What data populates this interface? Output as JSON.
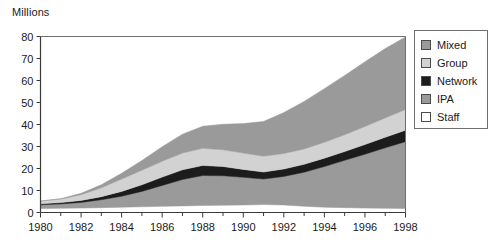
{
  "chart_data": {
    "type": "area",
    "stacked": true,
    "title": "",
    "subtitle": "",
    "unit_label": "Millions",
    "xlabel": "",
    "ylabel": "Millions",
    "xlim": [
      1980,
      1998
    ],
    "ylim": [
      0,
      80
    ],
    "y_ticks": [
      0,
      10,
      20,
      30,
      40,
      50,
      60,
      70,
      80
    ],
    "x_ticks": [
      1980,
      1982,
      1984,
      1986,
      1988,
      1990,
      1992,
      1994,
      1996,
      1998
    ],
    "x_tick_labels": [
      "1980",
      "1982",
      "1984",
      "1986",
      "1988",
      "1990",
      "1992",
      "1994",
      "1996",
      "1998"
    ],
    "y_tick_labels": [
      "0",
      "10",
      "20",
      "30",
      "40",
      "50",
      "60",
      "70",
      "80"
    ],
    "x_minor_ticks": [
      1981,
      1983,
      1985,
      1987,
      1989,
      1991,
      1993,
      1995,
      1997
    ],
    "grid": false,
    "legend_position": "right",
    "x": [
      1980,
      1981,
      1982,
      1983,
      1984,
      1985,
      1986,
      1987,
      1988,
      1989,
      1990,
      1991,
      1992,
      1993,
      1994,
      1995,
      1996,
      1997,
      1998
    ],
    "series": [
      {
        "name": "Staff",
        "color": "#ffffff",
        "values": [
          1.8,
          1.9,
          2.0,
          2.2,
          2.4,
          2.6,
          2.8,
          3.0,
          3.2,
          3.3,
          3.4,
          3.6,
          3.4,
          2.8,
          2.4,
          2.2,
          2.0,
          1.9,
          1.8
        ]
      },
      {
        "name": "IPA",
        "color": "#9a9a9a",
        "values": [
          1.7,
          2.0,
          2.6,
          3.6,
          5.0,
          7.0,
          9.5,
          12.0,
          13.6,
          13.4,
          12.6,
          11.6,
          13.0,
          15.5,
          18.5,
          21.5,
          24.5,
          27.5,
          30.4
        ]
      },
      {
        "name": "Network",
        "color": "#1c1c1c",
        "values": [
          0.5,
          0.6,
          0.9,
          1.4,
          2.2,
          3.0,
          3.8,
          4.4,
          4.6,
          4.2,
          3.6,
          3.2,
          3.4,
          3.6,
          3.8,
          4.0,
          4.4,
          4.8,
          5.2
        ]
      },
      {
        "name": "Group",
        "color": "#d2d2d2",
        "values": [
          1.2,
          1.6,
          2.6,
          4.0,
          5.6,
          6.6,
          7.2,
          7.6,
          7.8,
          7.6,
          7.4,
          7.2,
          7.0,
          7.0,
          7.2,
          7.6,
          8.2,
          8.8,
          9.4
        ]
      },
      {
        "name": "Mixed",
        "color": "#9a9a9a",
        "values": [
          0.0,
          0.2,
          0.6,
          1.4,
          2.6,
          4.4,
          6.6,
          8.6,
          10.0,
          11.6,
          13.4,
          15.8,
          18.6,
          21.6,
          24.4,
          27.0,
          29.4,
          31.5,
          33.0
        ]
      }
    ],
    "totals": [
      5.2,
      6.3,
      8.7,
      12.6,
      17.8,
      23.6,
      29.9,
      35.6,
      39.2,
      40.1,
      40.4,
      41.4,
      45.4,
      50.5,
      56.3,
      62.3,
      68.5,
      74.5,
      79.8
    ]
  },
  "legend": {
    "items": [
      {
        "label": "Mixed",
        "color": "#9a9a9a"
      },
      {
        "label": "Group",
        "color": "#d2d2d2"
      },
      {
        "label": "Network",
        "color": "#1c1c1c"
      },
      {
        "label": "IPA",
        "color": "#9a9a9a"
      },
      {
        "label": "Staff",
        "color": "#ffffff"
      }
    ]
  },
  "axis_color": "#6e6e6e",
  "text_color": "#1a1a1a"
}
